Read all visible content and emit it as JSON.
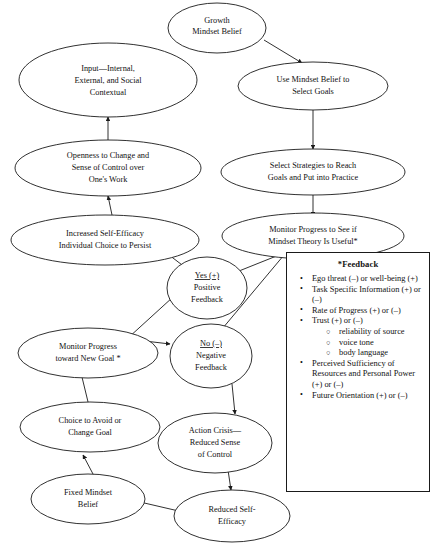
{
  "diagram": {
    "nodes": [
      {
        "id": "growth",
        "label_lines": [
          "Growth",
          "Mindset Belief"
        ]
      },
      {
        "id": "input",
        "label_lines": [
          "Input—Internal,",
          "External, and Social",
          "Contextual"
        ]
      },
      {
        "id": "use_mindset",
        "label_lines": [
          "Use Mindset Belief to",
          "Select Goals"
        ]
      },
      {
        "id": "openness",
        "label_lines": [
          "Openness to Change and",
          "Sense of Control over",
          "One's Work"
        ]
      },
      {
        "id": "strategies",
        "label_lines": [
          "Select Strategies to Reach",
          "Goals and Put into Practice"
        ]
      },
      {
        "id": "self_efficacy",
        "label_lines": [
          "Increased Self-Efficacy",
          "Individual Choice to Persist"
        ]
      },
      {
        "id": "monitor",
        "label_lines": [
          "Monitor Progress to See if",
          "Mindset Theory Is Useful*"
        ]
      },
      {
        "id": "yes",
        "label_lines": [
          "Yes (+)",
          "Positive",
          "Feedback"
        ],
        "underline_first": true
      },
      {
        "id": "no",
        "label_lines": [
          "No (–)",
          "Negative",
          "Feedback"
        ],
        "underline_first": true
      },
      {
        "id": "monitor_new",
        "label_lines": [
          "Monitor Progress",
          "toward New Goal *"
        ]
      },
      {
        "id": "choice_avoid",
        "label_lines": [
          "Choice to Avoid or",
          "Change Goal"
        ]
      },
      {
        "id": "action_crisis",
        "label_lines": [
          "Action Crisis—",
          "Reduced Sense",
          "of Control"
        ]
      },
      {
        "id": "fixed",
        "label_lines": [
          "Fixed Mindset",
          "Belief"
        ]
      },
      {
        "id": "reduced_se",
        "label_lines": [
          "Reduced Self-",
          "Efficacy"
        ]
      }
    ]
  },
  "feedback_panel": {
    "title": "*Feedback",
    "bullet_glyph": "•",
    "sub_bullet_glyph": "○",
    "items": [
      {
        "text": "Ego threat (–) or well-being (+)"
      },
      {
        "text": "Task Specific Information (+) or (–)"
      },
      {
        "text": "Rate of Progress (+) or (–)"
      },
      {
        "text": "Trust (+) or (–)",
        "sub": [
          "reliability of source",
          "voice tone",
          "body language"
        ]
      },
      {
        "text": "Perceived Sufficiency of Resources and Personal Power (+) or (–)"
      },
      {
        "text": "Future Orientation  (+) or (–)"
      }
    ]
  },
  "caption": {
    "text": ""
  },
  "colors": {
    "ink": "#1a1a1a",
    "paper": "#ffffff"
  }
}
